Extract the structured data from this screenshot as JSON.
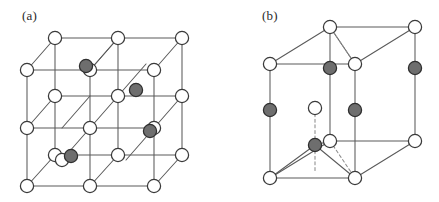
{
  "figure": {
    "background_color": "#ffffff",
    "width": 439,
    "height": 202
  },
  "style": {
    "open_atom_fill": "#ffffff",
    "open_atom_stroke": "#3a3a3a",
    "filled_atom_fill": "#6e6e6e",
    "filled_atom_stroke": "#2f2f2f",
    "edge_color": "#5a5a5a",
    "dashed_edge_color": "#8c8c8c",
    "atom_radius": 6.6,
    "edge_width": 1.05
  },
  "panels": [
    {
      "id": "a",
      "label": "(a)",
      "label_x": 22,
      "label_y": 8,
      "structure": "cubic-diamond-zincblende",
      "description": "Cubic unit cell drawn as a 2x2 grid of smaller cubes in oblique projection, with open-circle atoms on the lattice sites and four shaded atoms at interior tetrahedral positions.",
      "edges": [
        [
          55,
          38,
          182,
          38
        ],
        [
          55,
          38,
          55,
          155
        ],
        [
          182,
          38,
          182,
          155
        ],
        [
          55,
          155,
          182,
          155
        ],
        [
          118,
          38,
          118,
          155
        ],
        [
          55,
          96,
          182,
          96
        ],
        [
          27,
          70,
          154,
          70
        ],
        [
          27,
          70,
          27,
          186
        ],
        [
          154,
          70,
          154,
          186
        ],
        [
          27,
          186,
          154,
          186
        ],
        [
          90,
          70,
          90,
          186
        ],
        [
          27,
          128,
          154,
          128
        ],
        [
          55,
          38,
          27,
          70
        ],
        [
          182,
          38,
          154,
          70
        ],
        [
          55,
          155,
          27,
          186
        ],
        [
          182,
          155,
          154,
          186
        ],
        [
          118,
          38,
          90,
          70
        ],
        [
          55,
          96,
          27,
          128
        ],
        [
          182,
          96,
          154,
          128
        ],
        [
          118,
          155,
          90,
          186
        ],
        [
          90,
          70,
          118,
          38
        ],
        [
          62,
          128,
          90,
          96
        ],
        [
          118,
          96,
          146,
          64
        ],
        [
          90,
          128,
          118,
          96
        ],
        [
          62,
          160,
          90,
          128
        ],
        [
          126,
          160,
          154,
          128
        ]
      ],
      "atoms_open": [
        [
          55,
          38
        ],
        [
          118,
          38
        ],
        [
          182,
          38
        ],
        [
          27,
          70
        ],
        [
          90,
          70
        ],
        [
          154,
          70
        ],
        [
          55,
          96
        ],
        [
          118,
          96
        ],
        [
          182,
          96
        ],
        [
          27,
          128
        ],
        [
          90,
          128
        ],
        [
          154,
          128
        ],
        [
          55,
          155
        ],
        [
          118,
          155
        ],
        [
          182,
          155
        ],
        [
          27,
          186
        ],
        [
          90,
          186
        ],
        [
          154,
          186
        ],
        [
          62,
          160
        ]
      ],
      "atoms_filled": [
        [
          86,
          66
        ],
        [
          136,
          90
        ],
        [
          71,
          156
        ],
        [
          150,
          131
        ]
      ]
    },
    {
      "id": "b",
      "label": "(b)",
      "label_x": 262,
      "label_y": 8,
      "structure": "hexagonal-wurtzite",
      "description": "Hexagonal (wurtzite) unit cell drawn as a rhombic prism in oblique projection, with open-circle atoms at the prism vertices, shaded atoms on the vertical edges and an interior open atom joined by a dashed line to a shaded atom below.",
      "edges": [
        [
          270,
          64,
          355,
          64
        ],
        [
          330,
          27,
          415,
          27
        ],
        [
          270,
          64,
          330,
          27
        ],
        [
          355,
          64,
          415,
          27
        ],
        [
          270,
          64,
          270,
          178
        ],
        [
          355,
          64,
          355,
          178
        ],
        [
          330,
          27,
          330,
          141
        ],
        [
          415,
          27,
          415,
          141
        ],
        [
          270,
          178,
          355,
          178
        ],
        [
          330,
          141,
          415,
          141
        ],
        [
          270,
          178,
          330,
          141
        ],
        [
          355,
          178,
          415,
          141
        ],
        [
          330,
          27,
          355,
          64
        ],
        [
          270,
          178,
          315,
          145
        ],
        [
          355,
          178,
          315,
          145
        ],
        [
          330,
          141,
          315,
          145
        ]
      ],
      "edges_dashed": [
        [
          330,
          27,
          355,
          64
        ],
        [
          330,
          141,
          355,
          178
        ],
        [
          315,
          108,
          315,
          145
        ],
        [
          315,
          145,
          315,
          172
        ]
      ],
      "atoms_open": [
        [
          330,
          27
        ],
        [
          415,
          27
        ],
        [
          270,
          64
        ],
        [
          355,
          64
        ],
        [
          315,
          108
        ],
        [
          330,
          141
        ],
        [
          415,
          141
        ],
        [
          270,
          178
        ],
        [
          355,
          178
        ]
      ],
      "atoms_filled": [
        [
          330,
          68
        ],
        [
          415,
          68
        ],
        [
          270,
          110
        ],
        [
          355,
          110
        ],
        [
          315,
          145
        ]
      ]
    }
  ]
}
